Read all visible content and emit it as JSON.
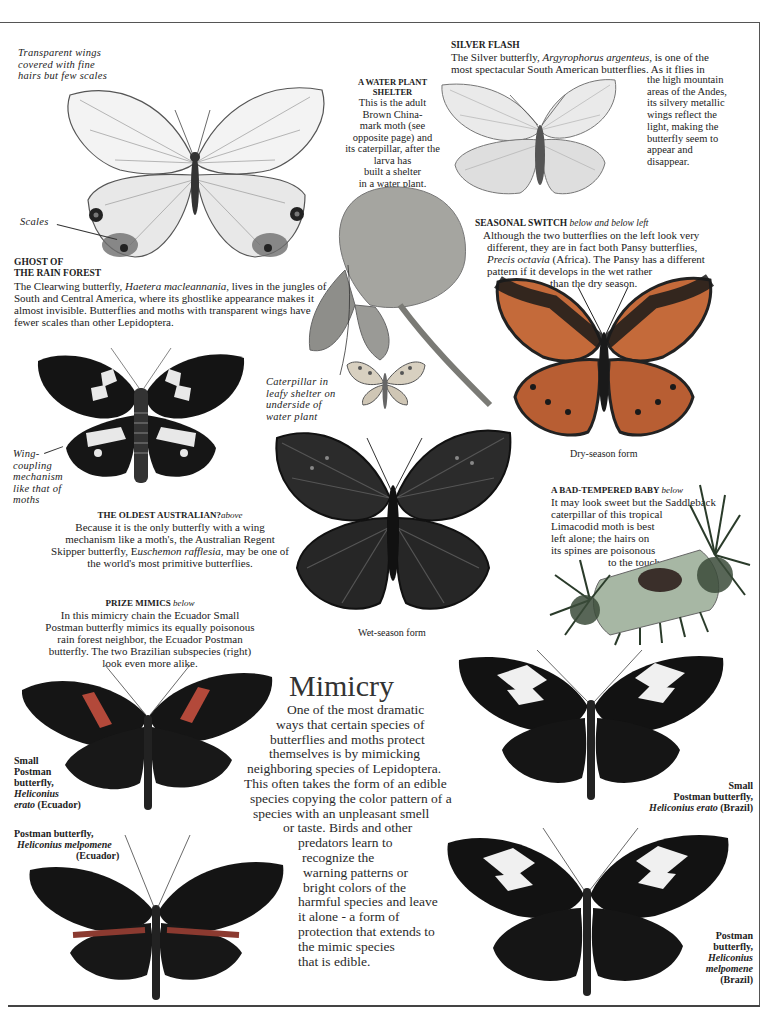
{
  "page": {
    "transparent_wings_note": [
      "Transparent wings",
      "covered with fine",
      "hairs but few scales"
    ],
    "scales_label": "Scales",
    "ghost": {
      "heading_line1": "GHOST OF",
      "heading_line2": "THE RAIN FOREST",
      "body_pre": "The Clearwing butterfly, ",
      "species": "Haetera macleannania,",
      "body_post": " lives in the jungles of South and Central America, where its ghostlike appearance makes it almost invisible. Butterflies and moths with transparent wings have fewer scales than other Lepidoptera."
    },
    "water_plant": {
      "heading_line1": "A WATER PLANT",
      "heading_line2": "SHELTER",
      "lines": [
        "This is the adult",
        "Brown China-",
        "mark moth (see",
        "opposite page) and",
        "its caterpillar, after the",
        "larva  has",
        "built a shelter",
        "in a water plant."
      ]
    },
    "silver_flash": {
      "heading": "SILVER FLASH",
      "line1_pre": "The Silver butterfly, ",
      "line1_species": "Argyrophorus argenteus,",
      "line1_post": " is one of the",
      "line2": "most spectacular South American butterflies. As it flies in",
      "wrap_lines": [
        "the high mountain",
        "areas of the Andes,",
        "its silvery metallic",
        "wings reflect the",
        "light, making the",
        "butterfly seem to",
        "appear and",
        "disappear."
      ]
    },
    "seasonal": {
      "heading": "SEASONAL SWITCH",
      "heading_note": "below and below left",
      "line1": "Although the two butterflies on the left look very",
      "line2": "different, they are in fact both Pansy butterflies,",
      "line3_species": "Precis octavia",
      "line3_post": "  (Africa). The Pansy has a different",
      "line4": "pattern if it develops in the wet rather",
      "line5": "than the dry season."
    },
    "caterpillar_note": [
      "Caterpillar  in",
      "leafy  shelter on",
      "underside of",
      "water  plant"
    ],
    "dry_season_label": "Dry-season form",
    "wet_season_label": "Wet-season form",
    "wing_coupling_note": [
      "Wing-",
      "coupling",
      "mechanism",
      "like  that  of",
      "moths"
    ],
    "oldest": {
      "heading": "THE OLDEST AUSTRALIAN?",
      "heading_note": "above",
      "line1": "Because it is the only butterfly with a wing",
      "line2": "mechanism like a moth's, the Australian Regent",
      "line3_pre": "Skipper butterfly, E",
      "line3_species": "uschemon rafflesia,",
      "line3_post": "  may be one of",
      "line4": "the world's most primitive butterflies."
    },
    "bad_baby": {
      "heading": "A BAD-TEMPERED BABY",
      "heading_note": "below",
      "lines": [
        "It may look sweet but the Saddleback",
        "caterpillar of this tropical",
        "Limacodid moth is best",
        "left alone; the hairs on",
        "its spines are poisonous",
        "to the touch."
      ]
    },
    "prize": {
      "heading": "PRIZE MIMICS",
      "heading_note": "below",
      "lines": [
        "In this mimicry chain the Ecuador Small",
        "Postman butterfly mimics its equally poisonous",
        "rain forest neighbor, the Ecuador Postman",
        "butterfly. The two Brazilian subspecies (right)",
        "look even more alike."
      ]
    },
    "mimicry": {
      "title": "Mimicry",
      "lines": [
        "One of the most dramatic",
        "ways that certain species of",
        "butterflies and moths protect",
        "themselves is by mimicking",
        "neighboring species of Lepidoptera.",
        "This often takes the form of an edible",
        "species copying the color pattern of a",
        "species with an unpleasant smell",
        "or taste. Birds and other",
        "predators learn to",
        "recognize the",
        "warning patterns or",
        "bright colors of the",
        "harmful species and leave",
        "it alone - a form of",
        "protection that extends to",
        "the mimic species",
        "that  is  edible."
      ]
    },
    "labels": {
      "small_postman_ecuador": [
        "Small",
        "Postman",
        "butterfly,"
      ],
      "small_postman_ecuador_species1": "Heliconius",
      "small_postman_ecuador_species2": "erato",
      "small_postman_ecuador_place": "(Ecuador)",
      "postman_ecuador_line1": "Postman butterfly,",
      "postman_ecuador_species": "Heliconius melpomene",
      "postman_ecuador_place": "(Ecuador)",
      "small_postman_brazil_line1": "Small",
      "small_postman_brazil_line2": "Postman butterfly,",
      "small_postman_brazil_species": "Heliconius erato",
      "small_postman_brazil_place": "(Brazil)",
      "postman_brazil": [
        "Postman",
        "butterfly,"
      ],
      "postman_brazil_species": [
        "Heliconius",
        "melpomene"
      ],
      "postman_brazil_place": "(Brazil)"
    },
    "colors": {
      "ink": "#222222",
      "wing_dark": "#1a1a1a",
      "wing_red": "#b3493a",
      "pansy_orange": "#c46a3a",
      "leaf": "#9a9a90",
      "caterpillar_green": "#8fa58a"
    }
  }
}
